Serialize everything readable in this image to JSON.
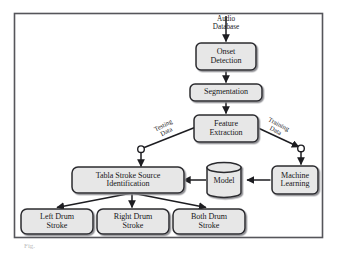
{
  "figure": {
    "frame": {
      "border_color": "#55555a",
      "background": "#ffffff"
    },
    "node_style": {
      "fill": "#e7e7e7",
      "stroke": "#2b2b2f",
      "shadow": "#8a8a90"
    }
  },
  "source": {
    "name": "audio-database",
    "label": "Audio\nDatabase"
  },
  "nodes": [
    {
      "id": "onset-detection",
      "label": "Onset\nDetection",
      "shape": "rounded-rect"
    },
    {
      "id": "segmentation",
      "label": "Segmentation",
      "shape": "rounded-rect"
    },
    {
      "id": "feature-extraction",
      "label": "Feature\nExtraction",
      "shape": "rounded-rect"
    },
    {
      "id": "tabla-stroke-source-identification",
      "label": "Tabla Stroke Source\nIdentification",
      "shape": "rounded-rect"
    },
    {
      "id": "model",
      "label": "Model",
      "shape": "cylinder"
    },
    {
      "id": "machine-learning",
      "label": "Machine\nLearning",
      "shape": "rounded-rect"
    },
    {
      "id": "left-drum-stroke",
      "label": "Left Drum\nStroke",
      "shape": "rounded-rect"
    },
    {
      "id": "right-drum-stroke",
      "label": "Right Drum\nStroke",
      "shape": "rounded-rect"
    },
    {
      "id": "both-drum-stroke",
      "label": "Both Drum\nStroke",
      "shape": "rounded-rect"
    }
  ],
  "edge_labels": [
    {
      "id": "testing-data",
      "label": "Testing\nData",
      "rotation": -27
    },
    {
      "id": "training-data",
      "label": "Training\nData",
      "rotation": 27
    }
  ],
  "caption": {
    "text": "Fig."
  }
}
